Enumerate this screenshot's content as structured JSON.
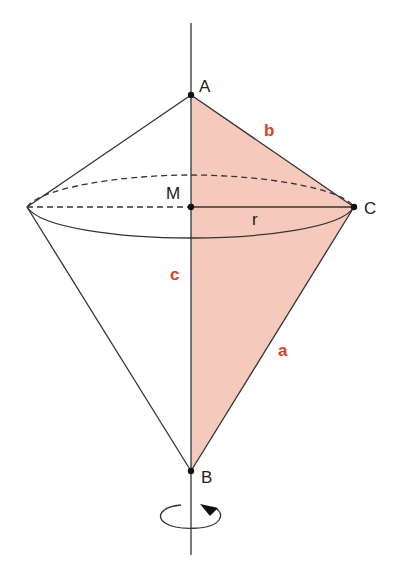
{
  "diagram": {
    "colors": {
      "fill": "#f6c9bd",
      "line": "#2b2b2b",
      "label_red": "#e0401f"
    },
    "points": {
      "A": "A",
      "B": "B",
      "C": "C",
      "M": "M"
    },
    "segments": {
      "a": "a",
      "b": "b",
      "c": "c",
      "r": "r"
    }
  }
}
